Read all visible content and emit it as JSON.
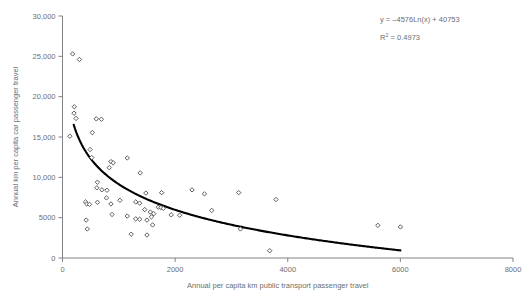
{
  "chart_data": {
    "type": "scatter",
    "title": "",
    "xlabel": "Annual per capita km public transport passenger travel",
    "ylabel": "Annual km per capita car passenger travel",
    "xlim": [
      0,
      8000
    ],
    "ylim": [
      0,
      30000
    ],
    "xticks": [
      0,
      2000,
      4000,
      6000,
      8000
    ],
    "xtick_labels": [
      "0",
      "2000",
      "4000",
      "6000",
      "8000"
    ],
    "yticks": [
      0,
      5000,
      10000,
      15000,
      20000,
      25000,
      30000
    ],
    "ytick_labels": [
      "0",
      "5000",
      "10,000",
      "15,000",
      "20,000",
      "25,000",
      "30,000"
    ],
    "grid": false,
    "legend": null,
    "marker": "open-diamond",
    "annotations": {
      "equation": "y = –4576Ln(x) + 40753",
      "r_squared_label": "R",
      "r_squared_sup": "2",
      "r_squared_value": "= 0.4973"
    },
    "trendline": {
      "type": "logarithmic",
      "a": -4576,
      "b": 40753,
      "r2": 0.4973,
      "x_start": 200,
      "x_end": 6000
    },
    "points": [
      [
        180,
        25300
      ],
      [
        300,
        24600
      ],
      [
        130,
        15100
      ],
      [
        210,
        18750
      ],
      [
        205,
        17950
      ],
      [
        240,
        17300
      ],
      [
        600,
        17250
      ],
      [
        690,
        17200
      ],
      [
        530,
        15550
      ],
      [
        490,
        13450
      ],
      [
        520,
        12450
      ],
      [
        860,
        11950
      ],
      [
        900,
        11800
      ],
      [
        830,
        11200
      ],
      [
        1150,
        12400
      ],
      [
        1380,
        10550
      ],
      [
        620,
        9400
      ],
      [
        610,
        8700
      ],
      [
        700,
        8450
      ],
      [
        790,
        8400
      ],
      [
        780,
        7450
      ],
      [
        860,
        6700
      ],
      [
        1020,
        7150
      ],
      [
        410,
        6950
      ],
      [
        430,
        6700
      ],
      [
        480,
        6650
      ],
      [
        620,
        6900
      ],
      [
        1300,
        6950
      ],
      [
        1370,
        6800
      ],
      [
        1480,
        8050
      ],
      [
        1760,
        8100
      ],
      [
        1460,
        6000
      ],
      [
        1560,
        5700
      ],
      [
        1620,
        5500
      ],
      [
        1700,
        6300
      ],
      [
        1750,
        6250
      ],
      [
        1790,
        6150
      ],
      [
        880,
        5400
      ],
      [
        1150,
        5200
      ],
      [
        1300,
        4850
      ],
      [
        1370,
        4800
      ],
      [
        1500,
        4700
      ],
      [
        1580,
        5100
      ],
      [
        1600,
        4100
      ],
      [
        1220,
        2950
      ],
      [
        1500,
        2850
      ],
      [
        420,
        4700
      ],
      [
        440,
        3600
      ],
      [
        1930,
        5350
      ],
      [
        2080,
        5300
      ],
      [
        2300,
        8450
      ],
      [
        2520,
        7950
      ],
      [
        2650,
        5900
      ],
      [
        3130,
        8100
      ],
      [
        3160,
        3600
      ],
      [
        3680,
        900
      ],
      [
        3790,
        7250
      ],
      [
        5600,
        4050
      ],
      [
        6000,
        3850
      ]
    ]
  }
}
